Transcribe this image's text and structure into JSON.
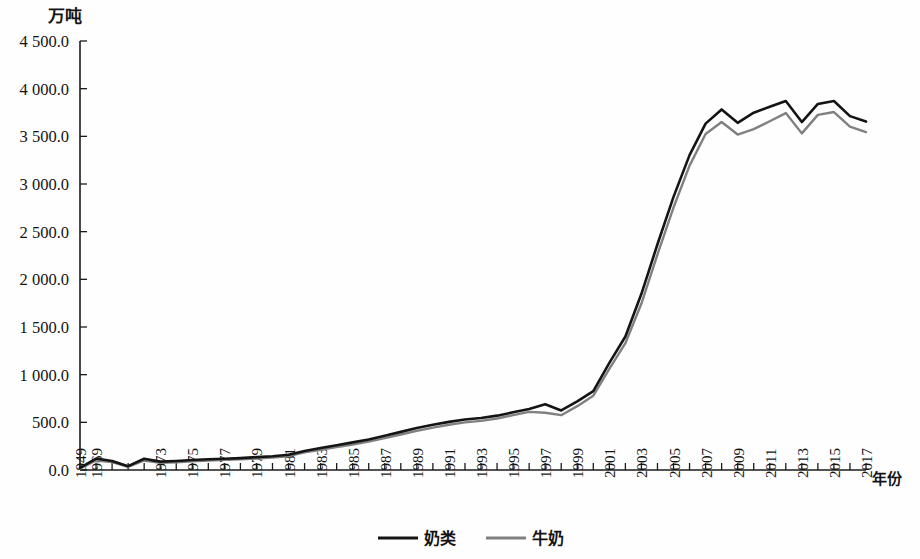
{
  "chart_data": {
    "type": "line",
    "title": "",
    "ylabel": "万吨",
    "xlabel": "年份",
    "ylim": [
      0,
      4500
    ],
    "ytick_step": 500,
    "ytick_labels": [
      "0.0",
      "500.0",
      "1 000.0",
      "1 500.0",
      "2 000.0",
      "2 500.0",
      "3 000.0",
      "3 500.0",
      "4 000.0",
      "4 500.0"
    ],
    "grid": false,
    "legend_position": "bottom-center",
    "colors": {
      "series_a": "#141414",
      "series_b": "#808080"
    },
    "x_tick_labels": [
      "1949",
      "1969",
      "1973",
      "1975",
      "1977",
      "1979",
      "1981",
      "1983",
      "1985",
      "1987",
      "1989",
      "1991",
      "1993",
      "1995",
      "1997",
      "1999",
      "2001",
      "2003",
      "2005",
      "2007",
      "2009",
      "2011",
      "2013",
      "2015",
      "2017"
    ],
    "x": [
      1949,
      1969,
      1970,
      1971,
      1972,
      1973,
      1974,
      1975,
      1976,
      1977,
      1978,
      1979,
      1980,
      1981,
      1982,
      1983,
      1984,
      1985,
      1986,
      1987,
      1988,
      1989,
      1990,
      1991,
      1992,
      1993,
      1994,
      1995,
      1996,
      1997,
      1998,
      1999,
      2000,
      2001,
      2002,
      2003,
      2004,
      2005,
      2006,
      2007,
      2008,
      2009,
      2010,
      2011,
      2012,
      2013,
      2014,
      2015,
      2016,
      2017
    ],
    "series": [
      {
        "name": "奶类",
        "color": "#141414",
        "values": [
          22,
          120,
          95,
          40,
          118,
          88,
          95,
          105,
          112,
          118,
          125,
          135,
          145,
          160,
          200,
          230,
          260,
          290,
          320,
          360,
          400,
          440,
          475,
          505,
          530,
          545,
          570,
          605,
          640,
          690,
          625,
          720,
          827,
          1123,
          1400,
          1848,
          2368,
          2865,
          3303,
          3633,
          3782,
          3642,
          3748,
          3810,
          3870,
          3650,
          3840,
          3870,
          3712,
          3655
        ]
      },
      {
        "name": "牛奶",
        "color": "#808080",
        "values": [
          15,
          100,
          82,
          32,
          100,
          75,
          82,
          92,
          100,
          106,
          112,
          120,
          130,
          145,
          185,
          212,
          240,
          268,
          298,
          335,
          372,
          410,
          445,
          475,
          500,
          515,
          540,
          575,
          610,
          601,
          575,
          670,
          780,
          1060,
          1330,
          1746,
          2261,
          2753,
          3193,
          3525,
          3651,
          3519,
          3576,
          3658,
          3744,
          3531,
          3725,
          3755,
          3602,
          3545
        ]
      }
    ]
  },
  "legend": {
    "entries": [
      {
        "label": "奶类",
        "color": "#141414"
      },
      {
        "label": "牛奶",
        "color": "#808080"
      }
    ]
  },
  "axes": {
    "y_unit": "万吨",
    "x_unit": "年份"
  }
}
